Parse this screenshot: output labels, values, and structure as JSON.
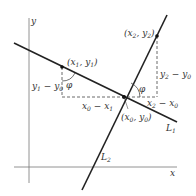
{
  "figure": {
    "axes": {
      "x_label": "x",
      "y_label": "y"
    },
    "lines": [
      {
        "name": "L1",
        "label_main": "L",
        "label_sub": "1"
      },
      {
        "name": "L2",
        "label_main": "L",
        "label_sub": "2"
      }
    ],
    "points": {
      "p0": {
        "label": "(x0, y0)",
        "parts": [
          "(x",
          "0",
          ", y",
          "0",
          ")"
        ]
      },
      "p1": {
        "label": "(x1, y1)",
        "parts": [
          "(x",
          "1",
          ", y",
          "1",
          ")"
        ]
      },
      "p2": {
        "label": "(x2, y2)",
        "parts": [
          "(x",
          "2",
          ", y",
          "2",
          ")"
        ]
      }
    },
    "dimensions": {
      "y1_minus_y0": {
        "label": "y1 − y0",
        "parts": [
          "y",
          "1",
          " − y",
          "0"
        ]
      },
      "x0_minus_x1": {
        "label": "x0 − x1",
        "parts": [
          "x",
          "0",
          " − x",
          "1"
        ]
      },
      "y2_minus_y0": {
        "label": "y2 − y0",
        "parts": [
          "y",
          "2",
          " − y",
          "0"
        ]
      },
      "x2_minus_x0": {
        "label": "x2 − x0",
        "parts": [
          "x",
          "2",
          " − x",
          "0"
        ]
      }
    },
    "angles": {
      "phi_symbol": "φ"
    },
    "colors": {
      "line": "#222222",
      "axis": "#777777",
      "dashed": "#444444",
      "text": "#333333"
    }
  }
}
